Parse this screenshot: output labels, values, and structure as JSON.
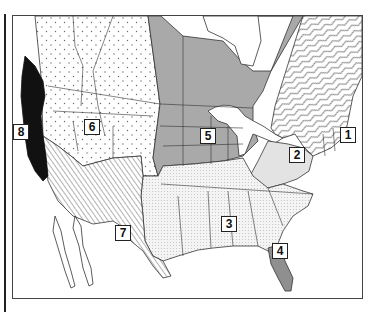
{
  "map": {
    "title": "",
    "regions": [
      {
        "id": "1",
        "label": "1",
        "pattern": "wavy-lines",
        "area": "Northeast / Eastern Canada",
        "fill": "#ffffff"
      },
      {
        "id": "2",
        "label": "2",
        "pattern": "light-gray",
        "area": "Mid-Atlantic",
        "fill": "#e3e3e3"
      },
      {
        "id": "3",
        "label": "3",
        "pattern": "fine-dots",
        "area": "Southeast",
        "fill": "#f1f1f1"
      },
      {
        "id": "4",
        "label": "4",
        "pattern": "dark-gray",
        "area": "Florida",
        "fill": "#8f8f8f"
      },
      {
        "id": "5",
        "label": "5",
        "pattern": "medium-gray",
        "area": "Central / Midwest / Central Canada",
        "fill": "#a9a9a9"
      },
      {
        "id": "6",
        "label": "6",
        "pattern": "sparse-dots",
        "area": "West / Rocky Mountains / Western Canada",
        "fill": "#ffffff"
      },
      {
        "id": "7",
        "label": "7",
        "pattern": "diagonal-hatch",
        "area": "Southwest desert",
        "fill": "#ffffff"
      },
      {
        "id": "8",
        "label": "8",
        "pattern": "solid-black",
        "area": "Pacific coast",
        "fill": "#111111"
      }
    ]
  }
}
